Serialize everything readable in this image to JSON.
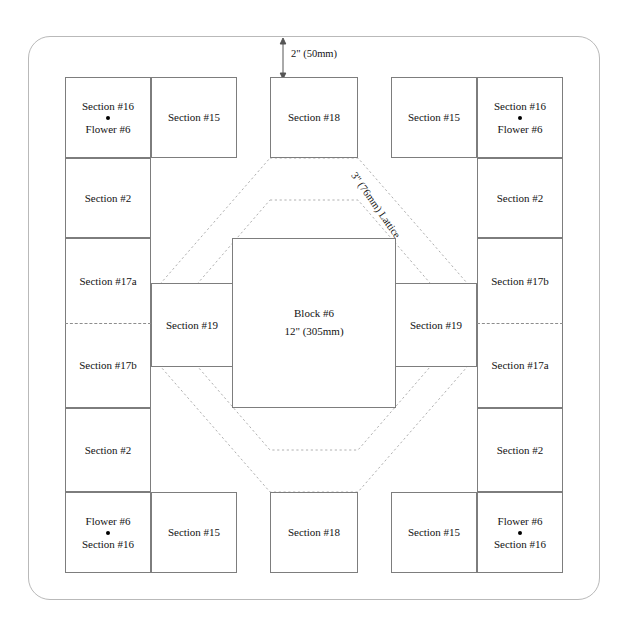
{
  "diagram": {
    "center_block": {
      "name": "Block #6",
      "size": "12\" (305mm)"
    },
    "dimension_top": "2\" (50mm)",
    "lattice_label": "3\" (76mm) Lattice",
    "labels": {
      "section_16": "Section #16",
      "section_15": "Section #15",
      "section_18": "Section #18",
      "section_2": "Section #2",
      "section_17a": "Section #17a",
      "section_17b": "Section #17b",
      "section_19": "Section #19",
      "flower_6": "Flower #6"
    },
    "cells": [
      {
        "id": "top-left-corner",
        "label": "Section #16",
        "sub": "Flower #6",
        "order": "label-dot-sub"
      },
      {
        "id": "top-left-15",
        "label": "Section #15"
      },
      {
        "id": "top-center-18",
        "label": "Section #18"
      },
      {
        "id": "top-right-15",
        "label": "Section #15"
      },
      {
        "id": "top-right-corner",
        "label": "Section #16",
        "sub": "Flower #6",
        "order": "label-dot-sub"
      },
      {
        "id": "left-upper-2",
        "label": "Section #2"
      },
      {
        "id": "right-upper-2",
        "label": "Section #2"
      },
      {
        "id": "left-17a",
        "label": "Section #17a"
      },
      {
        "id": "left-17b",
        "label": "Section #17b"
      },
      {
        "id": "left-19",
        "label": "Section #19"
      },
      {
        "id": "right-19",
        "label": "Section #19"
      },
      {
        "id": "right-17b",
        "label": "Section #17b"
      },
      {
        "id": "right-17a",
        "label": "Section #17a"
      },
      {
        "id": "left-lower-2",
        "label": "Section #2"
      },
      {
        "id": "right-lower-2",
        "label": "Section #2"
      },
      {
        "id": "bottom-left-corner",
        "label": "Section #16",
        "sub": "Flower #6",
        "order": "sub-dot-label"
      },
      {
        "id": "bottom-left-15",
        "label": "Section #15"
      },
      {
        "id": "bottom-center-18",
        "label": "Section #18"
      },
      {
        "id": "bottom-right-15",
        "label": "Section #15"
      },
      {
        "id": "bottom-right-corner",
        "label": "Section #16",
        "sub": "Flower #6",
        "order": "sub-dot-label"
      }
    ],
    "colors": {
      "frame": "#b9b9b9",
      "cell_border": "#7d7d7d",
      "lattice_line": "#b0b0b0",
      "guide_line": "#8d8d8d",
      "text": "#131313",
      "background": "#ffffff"
    }
  }
}
